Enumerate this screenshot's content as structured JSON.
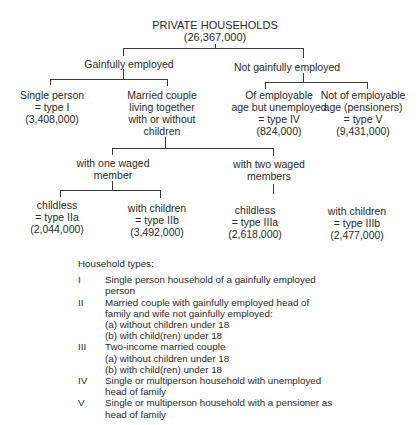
{
  "diagram": {
    "root": {
      "label": "PRIVATE HOUSEHOLDS",
      "value": "(26,367,000)"
    },
    "gainfully_employed": {
      "label": "Gainfully employed"
    },
    "not_gainfully_employed": {
      "label": "Not gainfully employed"
    },
    "single_person": {
      "lines": [
        "Single person",
        "= type I",
        "(3,408,000)"
      ]
    },
    "married_couple": {
      "lines": [
        "Married couple",
        "living together",
        "with or without",
        "children"
      ]
    },
    "unemployed": {
      "lines": [
        "Of  employable",
        "age but unemployed",
        "= type IV",
        "(824,000)"
      ]
    },
    "pensioners": {
      "lines": [
        "Not of employable",
        "age (pensioners)",
        "= type V",
        "(9,431,000)"
      ]
    },
    "one_waged": {
      "lines": [
        "with one waged",
        "member"
      ]
    },
    "two_waged": {
      "lines": [
        "with two waged",
        "members"
      ]
    },
    "type_IIa": {
      "lines": [
        "childless",
        "= type IIa",
        "(2,044,000)"
      ]
    },
    "type_IIb": {
      "lines": [
        "with children",
        "= type IIb",
        "(3,492,000)"
      ]
    },
    "type_IIIa": {
      "lines": [
        "childless",
        "= type IIIa",
        "(2,618,000)"
      ]
    },
    "type_IIIb": {
      "lines": [
        "with children",
        "= type IIIb",
        "(2,477,000)"
      ]
    }
  },
  "legend": {
    "title": "Household types:",
    "items": [
      {
        "num": "I",
        "lines": [
          "Single person household of a gainfully employed",
          "person"
        ]
      },
      {
        "num": "II",
        "lines": [
          "Married couple with gainfully employed head of",
          "family and wife not gainfully employed:",
          "(a) without children under 18",
          "(b) with child(ren) under 18"
        ]
      },
      {
        "num": "III",
        "lines": [
          "Two-income married couple",
          "(a) without children under 18",
          "(b) with child(ren) under 18"
        ]
      },
      {
        "num": "IV",
        "lines": [
          "Single or multiperson household with unemployed",
          "head of family"
        ]
      },
      {
        "num": "V",
        "lines": [
          "Single or multiperson household with a pensioner as",
          "head of family"
        ]
      }
    ]
  }
}
